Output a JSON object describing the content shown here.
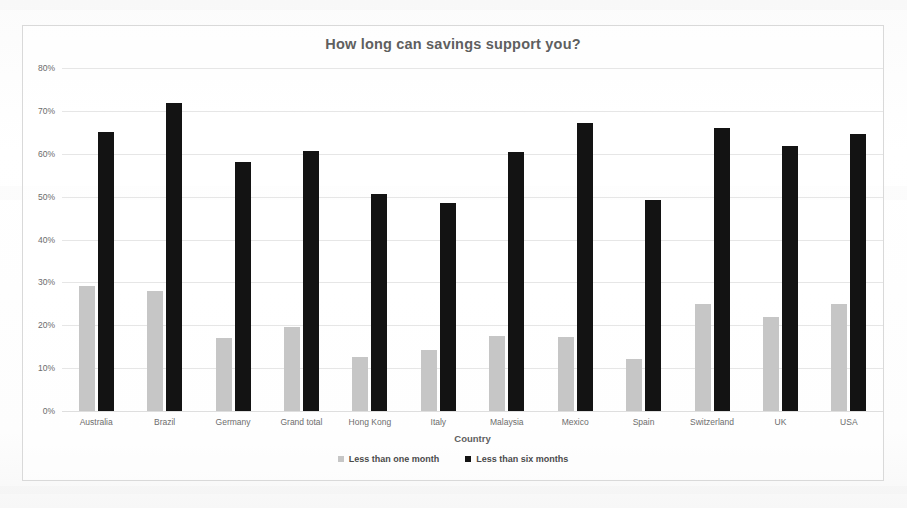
{
  "chart_data": {
    "type": "bar",
    "title": "How long can savings support you?",
    "xlabel": "Country",
    "ylabel": "",
    "ylim": [
      0,
      80
    ],
    "ytick_labels": [
      "80%",
      "70%",
      "60%",
      "50%",
      "40%",
      "30%",
      "20%",
      "10%",
      "0%"
    ],
    "ytick_values": [
      80,
      70,
      60,
      50,
      40,
      30,
      20,
      10,
      0
    ],
    "grid": true,
    "legend_position": "bottom",
    "categories": [
      "Australia",
      "Brazil",
      "Germany",
      "Grand total",
      "Hong Kong",
      "Italy",
      "Malaysia",
      "Mexico",
      "Spain",
      "Switzerland",
      "UK",
      "USA"
    ],
    "series": [
      {
        "name": "Less than one month",
        "color": "#c6c6c6",
        "values": [
          29.2,
          28.1,
          17.0,
          19.7,
          12.6,
          14.3,
          17.5,
          17.3,
          12.2,
          25.0,
          22.0,
          24.9
        ]
      },
      {
        "name": "Less than six months",
        "color": "#131313",
        "values": [
          65.0,
          71.8,
          58.0,
          60.6,
          50.5,
          48.5,
          60.3,
          67.2,
          49.2,
          66.0,
          61.8,
          64.7
        ]
      }
    ]
  },
  "colors": {
    "series_one": "#c6c6c6",
    "series_two": "#131313",
    "title_text": "#5f5f5f",
    "axis_text": "#6b6b6b",
    "gridline": "#e6e6e6",
    "frame_border": "#d9d9d9",
    "page_background": "#fdfdfd"
  }
}
